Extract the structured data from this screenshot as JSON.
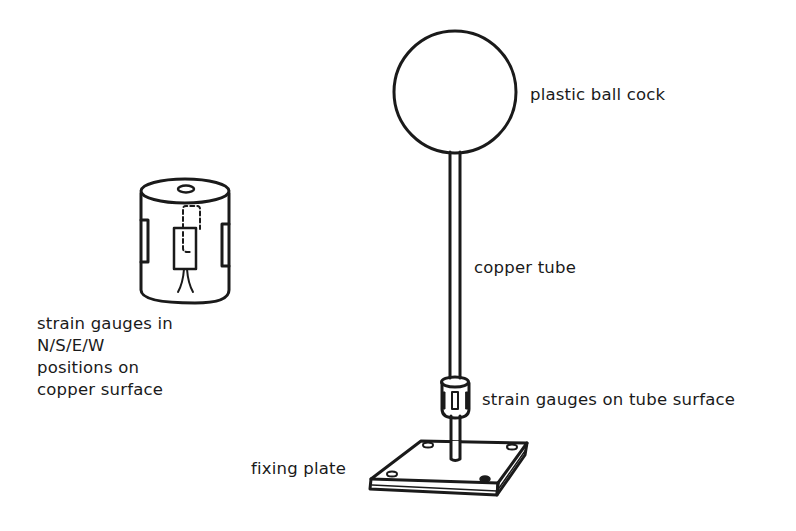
{
  "diagram": {
    "labels": {
      "ball": "plastic ball cock",
      "tube": "copper tube",
      "gauges_on_tube": "strain gauges on tube surface",
      "plate": "fixing plate",
      "detail_lines": [
        "strain gauges in",
        "N/S/E/W",
        "positions on",
        "copper surface"
      ]
    },
    "components": [
      {
        "id": "ball",
        "label": "plastic ball cock",
        "icon": "circle"
      },
      {
        "id": "tube",
        "label": "copper tube",
        "icon": "vertical-rod"
      },
      {
        "id": "gauge-sleeve",
        "label": "strain gauges on tube surface",
        "icon": "cylinder-sleeve"
      },
      {
        "id": "plate",
        "label": "fixing plate",
        "icon": "square-plate-with-4-holes"
      },
      {
        "id": "detail",
        "label": "strain gauges in N/S/E/W positions on copper surface",
        "icon": "cylinder-detail"
      }
    ],
    "colors": {
      "ink": "#1a1a1a",
      "background": "#ffffff"
    }
  }
}
